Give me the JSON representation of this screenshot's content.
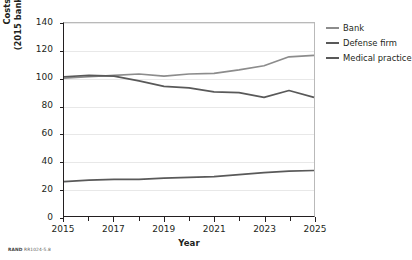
{
  "chart_data": {
    "type": "line",
    "title": "",
    "subtitle": "",
    "xlabel": "Year",
    "ylabel": "Costs over time, by percentage (2015 bank losses to cyberattack = 100%)",
    "ylabel_line1": "Costs over time, by percentage",
    "ylabel_line2": "(2015 bank losses to cyberattack = 100%)",
    "x": [
      2015,
      2016,
      2017,
      2018,
      2019,
      2020,
      2021,
      2022,
      2023,
      2024,
      2025
    ],
    "xlim": [
      2015,
      2025
    ],
    "ylim": [
      0,
      140
    ],
    "yticks": [
      0,
      20,
      40,
      60,
      80,
      100,
      120,
      140
    ],
    "ytick_labels": [
      "0",
      "20",
      "40",
      "60",
      "80",
      "100",
      "120",
      "140"
    ],
    "xticks_major": [
      2015,
      2017,
      2019,
      2021,
      2023,
      2025
    ],
    "xtick_labels": [
      "2015",
      "2017",
      "2019",
      "2021",
      "2023",
      "2025"
    ],
    "xticks_minor": [
      2016,
      2018,
      2020,
      2022,
      2024
    ],
    "grid": "horizontal",
    "legend_position": "right",
    "series": [
      {
        "name": "Bank",
        "color": "#8c8c8c",
        "values": [
          100,
          101,
          102,
          103,
          101.5,
          103,
          103.5,
          106,
          109,
          115.5,
          116.5
        ]
      },
      {
        "name": "Defense firm",
        "color": "#595959",
        "values": [
          101,
          102,
          101.5,
          98,
          94,
          93,
          90,
          89.5,
          86,
          91,
          86
        ]
      },
      {
        "name": "Medical practice",
        "color": "#595959",
        "values": [
          25,
          26,
          26.5,
          26.5,
          27.5,
          28,
          28.5,
          30,
          31.5,
          32.5,
          33
        ]
      }
    ]
  },
  "legend": {
    "items": [
      {
        "label": "Bank",
        "color": "#8c8c8c"
      },
      {
        "label": "Defense firm",
        "color": "#595959"
      },
      {
        "label": "Medical practice",
        "color": "#595959"
      }
    ]
  },
  "footer": {
    "rand_mark": "RAND",
    "figure_id": "RR1024-5.8"
  }
}
